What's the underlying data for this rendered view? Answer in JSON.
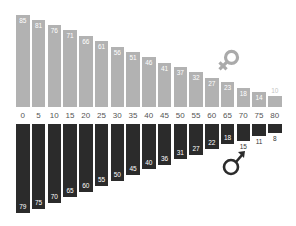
{
  "chart_data": {
    "type": "bar",
    "title": "",
    "xlabel": "",
    "ylabel": "",
    "layout": "mirrored vertical bars; female (gray) above age axis, male (dark) below",
    "categories": [
      "0",
      "5",
      "10",
      "15",
      "20",
      "25",
      "30",
      "35",
      "40",
      "45",
      "50",
      "55",
      "60",
      "65",
      "70",
      "75",
      "80"
    ],
    "series": [
      {
        "name": "female",
        "symbol": "♀",
        "color": "#b2b2b2",
        "values": [
          85,
          81,
          76,
          71,
          66,
          61,
          56,
          51,
          46,
          41,
          37,
          32,
          27,
          23,
          18,
          14,
          10
        ]
      },
      {
        "name": "male",
        "symbol": "♂",
        "color": "#2b2b2b",
        "values": [
          79,
          75,
          70,
          65,
          60,
          55,
          50,
          45,
          40,
          36,
          31,
          27,
          22,
          18,
          15,
          11,
          8
        ]
      }
    ],
    "grid": false,
    "legend": "gender symbols placed near right side of each series"
  },
  "legend": {
    "female_icon": "female-symbol-icon",
    "male_icon": "male-symbol-icon",
    "female_color": "#aaaaaa",
    "male_color": "#2b2b2b"
  }
}
